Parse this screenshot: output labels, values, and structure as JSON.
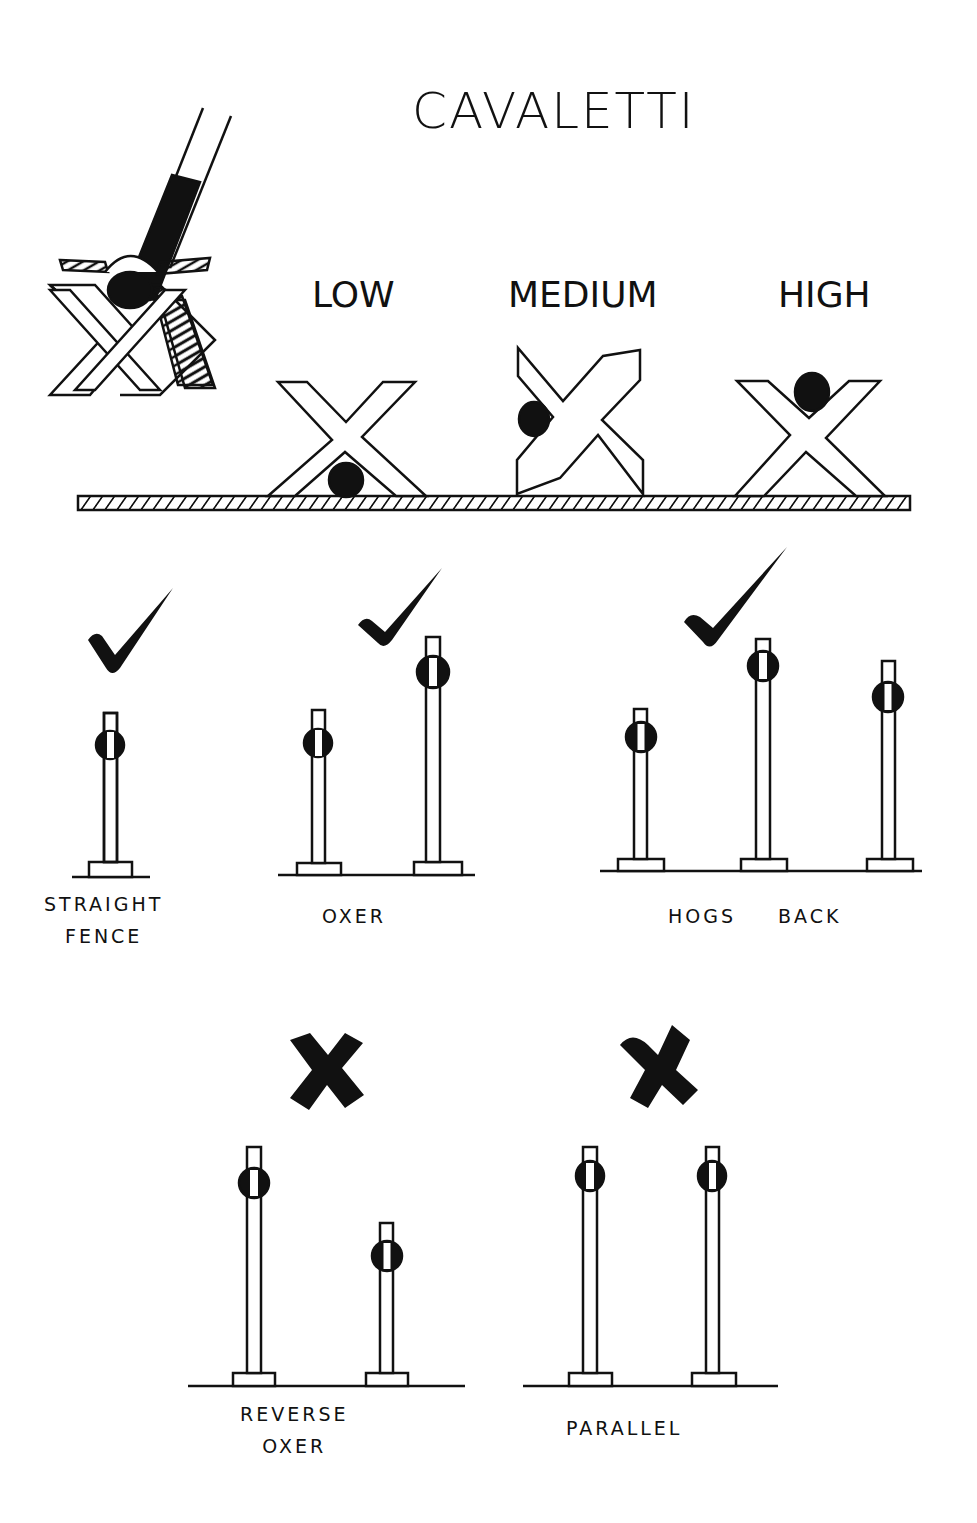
{
  "title": "CAVALETTI",
  "heights": {
    "low": "LOW",
    "medium": "MEDIUM",
    "high": "HIGH"
  },
  "fences": {
    "straight": {
      "line1": "STRAIGHT",
      "line2": "FENCE",
      "verdict": "check"
    },
    "oxer": {
      "line1": "OXER",
      "verdict": "check"
    },
    "hogs_back": {
      "line1": "HOGS",
      "line2": "BACK",
      "verdict": "check"
    },
    "reverse_oxer": {
      "line1": "REVERSE",
      "line2": "OXER",
      "verdict": "cross"
    },
    "parallel": {
      "line1": "PARALLEL",
      "verdict": "cross"
    }
  },
  "colors": {
    "ink": "#111111",
    "paper": "#ffffff"
  }
}
